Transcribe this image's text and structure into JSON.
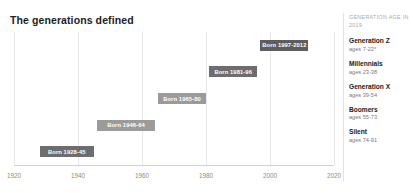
{
  "title": "The generations defined",
  "sidebar": {
    "header": "GENERATION AGE IN 2019",
    "items": [
      {
        "name": "Generation Z",
        "ages": "ages 7-22*"
      },
      {
        "name": "Millennials",
        "ages": "ages 23-38"
      },
      {
        "name": "Generation X",
        "ages": "ages 39-54"
      },
      {
        "name": "Boomers",
        "ages": "ages 55-73"
      },
      {
        "name": "Silent",
        "ages": "ages 74-91"
      }
    ]
  },
  "chart_data": {
    "type": "bar",
    "orientation": "horizontal-timeline",
    "title": "The generations defined",
    "xlabel": "",
    "ylabel": "",
    "xlim": [
      1920,
      2020
    ],
    "grid": true,
    "xticks": [
      1920,
      1940,
      1960,
      1980,
      2000,
      2020
    ],
    "xticklabels": [
      "1920",
      "1940",
      "1960",
      "1980",
      "2000",
      "2020"
    ],
    "legend_position": "right",
    "categories": [
      "Generation Z",
      "Millennials",
      "Generation X",
      "Boomers",
      "Silent"
    ],
    "series": [
      {
        "name": "Generation Z",
        "label": "Born 1997-2012",
        "start": 1997,
        "end": 2012,
        "row": 0,
        "age_label": "ages 7-22*",
        "color": "#5e5e5e"
      },
      {
        "name": "Millennials",
        "label": "Born 1981-96",
        "start": 1981,
        "end": 1996,
        "row": 1,
        "age_label": "ages 23-38",
        "color": "#6d6d6d"
      },
      {
        "name": "Generation X",
        "label": "Born 1965-80",
        "start": 1965,
        "end": 1980,
        "row": 2,
        "age_label": "ages 39-54",
        "color": "#9b9b9b"
      },
      {
        "name": "Boomers",
        "label": "Born 1946-64",
        "start": 1946,
        "end": 1964,
        "row": 3,
        "age_label": "ages 55-73",
        "color": "#9b9b9b"
      },
      {
        "name": "Silent",
        "label": "Born 1928-45",
        "start": 1928,
        "end": 1945,
        "row": 4,
        "age_label": "ages 74-91",
        "color": "#6d6d6d"
      }
    ]
  }
}
